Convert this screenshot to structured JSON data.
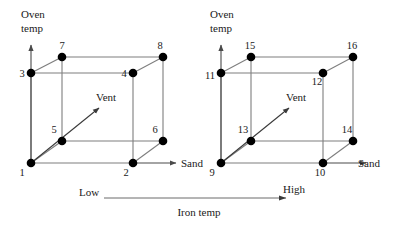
{
  "figure": {
    "title": "",
    "type": "two-cube-factorial-design-diagram",
    "background": "#ffffff",
    "axis_color": "#4a4a4a",
    "edge_color": "#7e7e7e",
    "vertex_color": "#000000",
    "text_color": "#1a1a1a"
  },
  "axes": {
    "vertical_label_line1": "Oven",
    "vertical_label_line2": "temp",
    "horizontal_label": "Sand",
    "diagonal_label": "Vent"
  },
  "scale": {
    "low_label": "Low",
    "high_label": "High",
    "caption": "Iron temp"
  },
  "cubes": [
    {
      "name": "left-cube",
      "iron_temp_level": "Low",
      "vertex_labels": {
        "front_bottom_left": "1",
        "front_bottom_right": "2",
        "front_top_left": "3",
        "front_top_right": "4",
        "back_bottom_left": "5",
        "back_bottom_right": "6",
        "back_top_left": "7",
        "back_top_right": "8"
      },
      "vertical_axis_caption_line1": "Oven",
      "vertical_axis_caption_line2": "temp",
      "horizontal_axis_caption": "Sand",
      "diagonal_axis_caption": "Vent"
    },
    {
      "name": "right-cube",
      "iron_temp_level": "High",
      "vertex_labels": {
        "front_bottom_left": "9",
        "front_bottom_right": "10",
        "front_top_left": "11",
        "front_top_right": "12",
        "back_bottom_left": "13",
        "back_bottom_right": "14",
        "back_top_left": "15",
        "back_top_right": "16"
      },
      "vertical_axis_caption_line1": "Oven",
      "vertical_axis_caption_line2": "temp",
      "horizontal_axis_caption": "Sand",
      "diagonal_axis_caption": "Vent"
    }
  ]
}
